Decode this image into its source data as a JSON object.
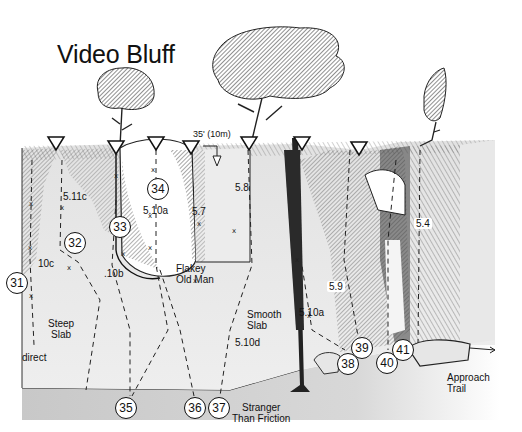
{
  "title": "Video Bluff",
  "scale": {
    "label": "35' (10m)"
  },
  "routes": [
    {
      "number": "31",
      "x": 6,
      "y": 272
    },
    {
      "number": "32",
      "x": 64,
      "y": 232
    },
    {
      "number": "33",
      "x": 109,
      "y": 216
    },
    {
      "number": "34",
      "x": 147,
      "y": 178
    },
    {
      "number": "35",
      "x": 115,
      "y": 397
    },
    {
      "number": "36",
      "x": 184,
      "y": 397
    },
    {
      "number": "37",
      "x": 208,
      "y": 397
    },
    {
      "number": "38",
      "x": 337,
      "y": 353
    },
    {
      "number": "39",
      "x": 351,
      "y": 337
    },
    {
      "number": "40",
      "x": 376,
      "y": 352
    },
    {
      "number": "41",
      "x": 392,
      "y": 339
    }
  ],
  "grades": [
    {
      "text": "5.11c",
      "x": 63,
      "y": 191
    },
    {
      "text": "5.10a",
      "x": 143,
      "y": 205
    },
    {
      "text": "5.7",
      "x": 192,
      "y": 206
    },
    {
      "text": "5.8",
      "x": 235,
      "y": 182
    },
    {
      "text": "10c",
      "x": 38,
      "y": 258
    },
    {
      "text": ".10b",
      "x": 104,
      "y": 268
    },
    {
      "text": "5.9",
      "x": 327,
      "y": 281
    },
    {
      "text": "5.10a",
      "x": 299,
      "y": 307
    },
    {
      "text": "5.10d",
      "x": 235,
      "y": 337
    },
    {
      "text": "5.4",
      "x": 414,
      "y": 218
    }
  ],
  "features": [
    {
      "text": "Steep\nSlab",
      "x": 48,
      "y": 318
    },
    {
      "text": "direct",
      "x": 22,
      "y": 352
    },
    {
      "text": "Flakey\nOld Man",
      "x": 176,
      "y": 263
    },
    {
      "text": "Smooth\nSlab",
      "x": 247,
      "y": 309
    },
    {
      "text": "Stranger\nThan Friction",
      "x": 232,
      "y": 402
    },
    {
      "text": "Approach\nTrail",
      "x": 447,
      "y": 372
    }
  ],
  "anchors": [
    {
      "x": 56,
      "y": 143
    },
    {
      "x": 116,
      "y": 147
    },
    {
      "x": 156,
      "y": 143
    },
    {
      "x": 191,
      "y": 147
    },
    {
      "x": 249,
      "y": 143
    },
    {
      "x": 302,
      "y": 143
    },
    {
      "x": 359,
      "y": 148
    }
  ],
  "colors": {
    "ink": "#111111",
    "ground": "#cfcfcf",
    "rock_shade": "#6e6e6e",
    "rock_light": "#e8e8e8"
  }
}
